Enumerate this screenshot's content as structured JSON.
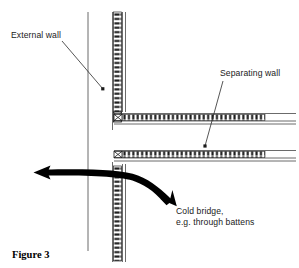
{
  "figure": {
    "caption": "Figure 3",
    "background_color": "#ffffff",
    "ink_color": "#1a1a1a"
  },
  "annotations": {
    "external_wall": {
      "label": "External wall",
      "leader": {
        "x1": 62,
        "y1": 41,
        "x2": 103,
        "y2": 89
      }
    },
    "separating_wall": {
      "label": "Separating wall",
      "leader": {
        "x1": 223,
        "y1": 81,
        "x2": 205,
        "y2": 146
      }
    },
    "cold_bridge": {
      "label_line1": "Cold bridge,",
      "label_line2": "e.g. through battens"
    }
  },
  "elements": {
    "external_wall_line": {
      "x": 88,
      "y_top": 12,
      "y_bottom": 251
    },
    "separating_wall_upper_vertical": {
      "x": 114,
      "y_top": 12,
      "y_bottom": 130
    },
    "separating_wall_lower_vertical": {
      "x": 114,
      "y_top": 162,
      "y_bottom": 262
    },
    "separating_wall_upper_horizontal": {
      "y": 121,
      "x_left": 116,
      "x_right": 295
    },
    "separating_wall_lower_horizontal": {
      "y": 158,
      "x_left": 116,
      "x_right": 295
    },
    "cold_bridge_arrow": {
      "tail_x": 176,
      "tail_y": 206,
      "head_x": 34,
      "head_y": 174
    }
  }
}
